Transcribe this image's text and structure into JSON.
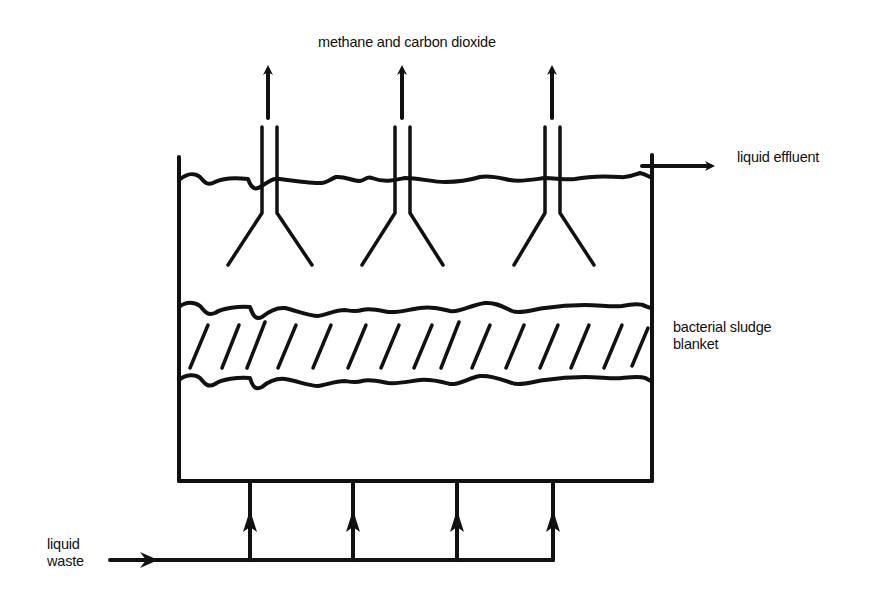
{
  "diagram": {
    "type": "UASB reactor schematic",
    "labels": {
      "gas_output": "methane and carbon dioxide",
      "liquid_effluent": "liquid effluent",
      "sludge_blanket_line1": "bacterial sludge",
      "sludge_blanket_line2": "blanket",
      "liquid_waste_line1": "liquid",
      "liquid_waste_line2": "waste"
    },
    "components": {
      "tank": {
        "left": 179,
        "right": 652,
        "top_left": 157,
        "top_right": 155,
        "bottom": 481
      },
      "gas_collectors": [
        {
          "id": 1,
          "arrow_x": 268,
          "pipe_left_x": 262,
          "pipe_right_x": 277,
          "flare_left_x": 228,
          "flare_right_x": 312
        },
        {
          "id": 2,
          "arrow_x": 402,
          "pipe_left_x": 395,
          "pipe_right_x": 410,
          "flare_left_x": 362,
          "flare_right_x": 443
        },
        {
          "id": 3,
          "arrow_x": 552,
          "pipe_left_x": 545,
          "pipe_right_x": 560,
          "flare_left_x": 514,
          "flare_right_x": 594
        }
      ],
      "inlet_risers_x": [
        250,
        353,
        457,
        553
      ],
      "inlet_pipe_y": 560,
      "hatch_count": 14
    },
    "colors": {
      "line": "#111111",
      "background": "#ffffff"
    }
  }
}
